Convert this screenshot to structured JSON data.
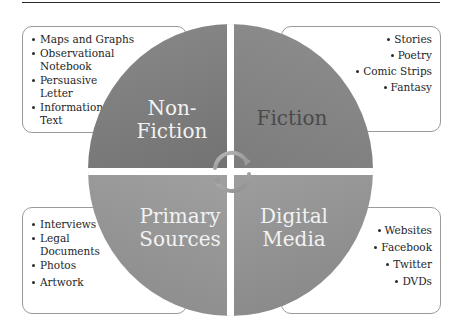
{
  "diagram": {
    "type": "quadrant-matrix",
    "colors": {
      "top_left_fill": "#7a7a7a",
      "top_right_fill": "#868686",
      "bottom_left_fill": "#969696",
      "bottom_right_fill": "#929292",
      "light_label": "#f2f2f2",
      "dark_label": "#4a4a4a",
      "box_border": "#9a9a9a"
    },
    "quadrants": [
      {
        "position": "top-left",
        "label_line1": "Non-",
        "label_line2": "Fiction",
        "items": [
          "Maps and Graphs",
          "Observational Notebook",
          "Persuasive Letter",
          "Informational Text"
        ]
      },
      {
        "position": "top-right",
        "label_line1": "Fiction",
        "label_line2": "",
        "items": [
          "Stories",
          "Poetry",
          "Comic Strips",
          "Fantasy"
        ]
      },
      {
        "position": "bottom-left",
        "label_line1": "Primary",
        "label_line2": "Sources",
        "items": [
          "Interviews",
          "Legal Documents",
          "Photos",
          "Artwork"
        ]
      },
      {
        "position": "bottom-right",
        "label_line1": "Digital",
        "label_line2": "Media",
        "items": [
          "Websites",
          "Facebook",
          "Twitter",
          "DVDs"
        ]
      }
    ],
    "center_icon": "circular-arrows-icon"
  }
}
